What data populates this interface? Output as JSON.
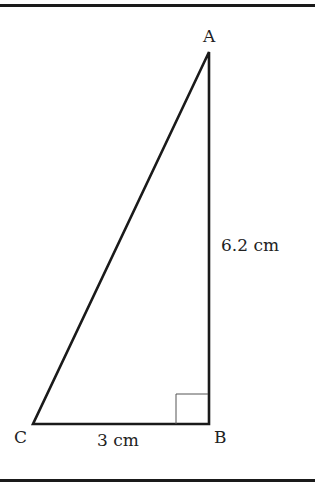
{
  "figure": {
    "type": "right-triangle",
    "vertices": {
      "A": {
        "label": "A",
        "x": 209,
        "y": 52
      },
      "B": {
        "label": "B",
        "x": 209,
        "y": 424
      },
      "C": {
        "label": "C",
        "x": 33,
        "y": 424
      }
    },
    "right_angle_at": "B",
    "sides": {
      "AB": {
        "label": "6.2 cm"
      },
      "BC": {
        "label": "3 cm"
      }
    },
    "colors": {
      "stroke": "#1a1a1a",
      "right_angle_marker": "#555555",
      "text": "#222222",
      "background": "#ffffff"
    }
  }
}
